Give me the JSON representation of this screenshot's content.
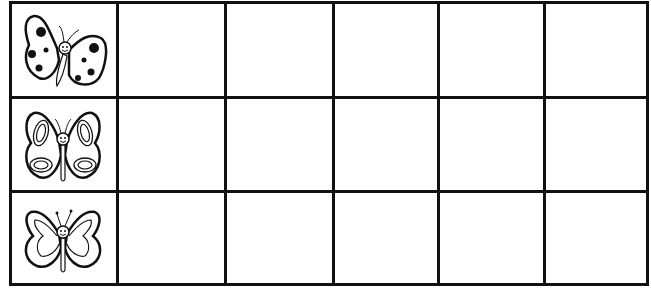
{
  "worksheet": {
    "type": "butterfly-tally-grid",
    "rows": [
      {
        "icon": "spotted-butterfly-icon",
        "label": "Spotted butterfly",
        "cells": [
          "",
          "",
          "",
          "",
          ""
        ]
      },
      {
        "icon": "ringed-butterfly-icon",
        "label": "Ringed-wing butterfly",
        "cells": [
          "",
          "",
          "",
          "",
          ""
        ]
      },
      {
        "icon": "plain-butterfly-icon",
        "label": "Plain-wing butterfly",
        "cells": [
          "",
          "",
          "",
          "",
          ""
        ]
      }
    ],
    "columns": 6,
    "empty_columns": 5,
    "colors": {
      "line": "#111111",
      "background": "#ffffff"
    }
  }
}
